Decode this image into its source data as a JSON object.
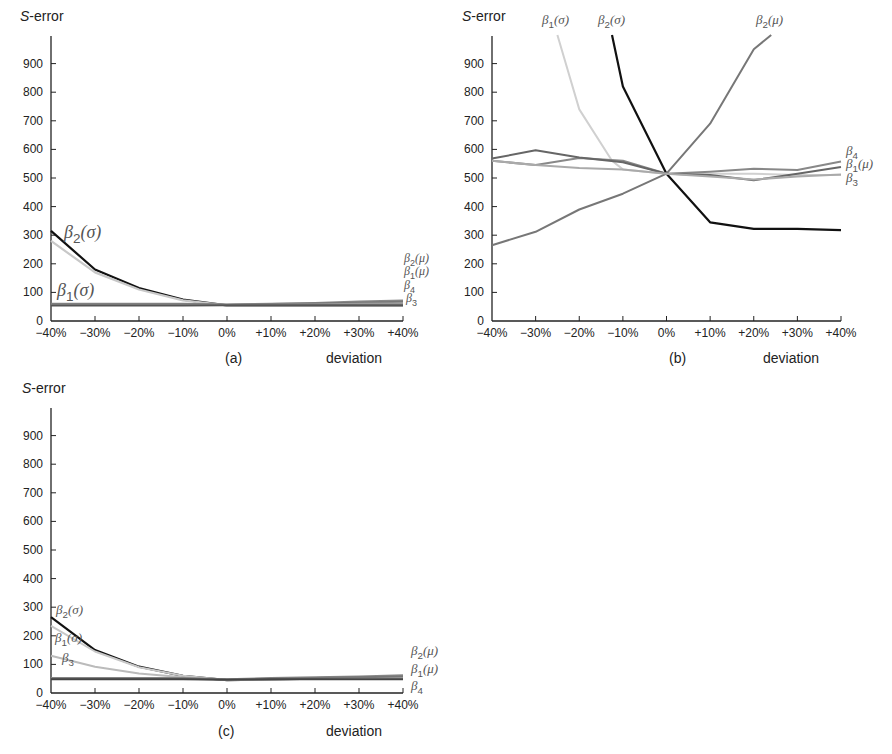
{
  "figure": {
    "ylabel_prefix": "S",
    "ylabel_suffix": "-error",
    "xlabel": "deviation"
  },
  "chart_data": [
    {
      "type": "line",
      "panel": "(a)",
      "title": "",
      "xlabel": "deviation",
      "ylabel": "S-error",
      "categories": [
        "-40%",
        "-30%",
        "-20%",
        "-10%",
        "0%",
        "+10%",
        "+20%",
        "+30%",
        "+40%"
      ],
      "yticks": [
        0,
        100,
        200,
        300,
        400,
        500,
        600,
        700,
        800,
        900
      ],
      "ylim": [
        0,
        1000
      ],
      "grid": false,
      "series": [
        {
          "name": "β2(σ)",
          "color": "#111111",
          "width": 2.2,
          "values": [
            315,
            180,
            115,
            75,
            55,
            55,
            55,
            55,
            55
          ]
        },
        {
          "name": "β1(σ)",
          "color": "#c8c8c8",
          "width": 2.2,
          "values": [
            280,
            170,
            110,
            72,
            55,
            55,
            55,
            55,
            55
          ]
        },
        {
          "name": "β2(μ)",
          "color": "#888888",
          "width": 2,
          "values": [
            60,
            60,
            60,
            60,
            58,
            60,
            63,
            68,
            72
          ]
        },
        {
          "name": "β1(μ)",
          "color": "#777777",
          "width": 2,
          "values": [
            58,
            58,
            58,
            58,
            57,
            59,
            61,
            64,
            67
          ]
        },
        {
          "name": "β4",
          "color": "#999999",
          "width": 2,
          "values": [
            56,
            56,
            56,
            56,
            56,
            57,
            58,
            60,
            62
          ]
        },
        {
          "name": "β3",
          "color": "#555555",
          "width": 2,
          "values": [
            54,
            54,
            54,
            54,
            55,
            55,
            55,
            55,
            55
          ]
        }
      ],
      "annotations": [
        {
          "text": "β2(σ)",
          "sub": "2",
          "base": "β",
          "arg": "(σ)",
          "x": 64,
          "y": 238,
          "size": 18,
          "color": "#222222"
        },
        {
          "text": "β1(σ)",
          "sub": "1",
          "base": "β",
          "arg": "(σ)",
          "x": 57,
          "y": 296,
          "size": 18,
          "color": "#444444"
        },
        {
          "text": "β2(μ)",
          "sub": "2",
          "base": "β",
          "arg": "(μ)",
          "x": 404,
          "y": 262,
          "size": 12,
          "color": "#666666"
        },
        {
          "text": "β1(μ)",
          "sub": "1",
          "base": "β",
          "arg": "(μ)",
          "x": 404,
          "y": 275,
          "size": 12,
          "color": "#666666"
        },
        {
          "text": "β4",
          "sub": "4",
          "base": "β",
          "arg": "",
          "x": 404,
          "y": 289,
          "size": 12,
          "color": "#666666"
        },
        {
          "text": "β3",
          "sub": "3",
          "base": "β",
          "arg": "",
          "x": 406,
          "y": 302,
          "size": 12,
          "color": "#666666"
        }
      ]
    },
    {
      "type": "line",
      "panel": "(b)",
      "title": "",
      "xlabel": "deviation",
      "ylabel": "S-error",
      "categories": [
        "-40%",
        "-30%",
        "-20%",
        "-10%",
        "0%",
        "+10%",
        "+20%",
        "+30%",
        "+40%"
      ],
      "yticks": [
        0,
        100,
        200,
        300,
        400,
        500,
        600,
        700,
        800,
        900
      ],
      "ylim": [
        0,
        1000
      ],
      "grid": false,
      "series": [
        {
          "name": "β2(σ)",
          "color": "#111111",
          "width": 2.2,
          "points": [
            [
              -12.5,
              1000
            ],
            [
              -10,
              820
            ],
            [
              0,
              515
            ],
            [
              10,
              345
            ],
            [
              20,
              322
            ],
            [
              30,
              322
            ],
            [
              40,
              318
            ]
          ]
        },
        {
          "name": "β1(σ)",
          "color": "#d0d0d0",
          "width": 2,
          "points": [
            [
              -25,
              1000
            ],
            [
              -20,
              740
            ],
            [
              -12.5,
              560
            ],
            [
              -10,
              530
            ],
            [
              0,
              515
            ],
            [
              10,
              515
            ],
            [
              20,
              515
            ],
            [
              30,
              510
            ],
            [
              40,
              510
            ]
          ]
        },
        {
          "name": "β2(μ)",
          "color": "#777777",
          "width": 2,
          "points": [
            [
              -40,
              265
            ],
            [
              -30,
              312
            ],
            [
              -20,
              390
            ],
            [
              -10,
              445
            ],
            [
              0,
              515
            ],
            [
              10,
              690
            ],
            [
              20,
              950
            ],
            [
              24,
              1000
            ]
          ]
        },
        {
          "name": "β4",
          "color": "#888888",
          "width": 2,
          "points": [
            [
              -40,
              560
            ],
            [
              -30,
              545
            ],
            [
              -20,
              570
            ],
            [
              -10,
              560
            ],
            [
              0,
              515
            ],
            [
              10,
              522
            ],
            [
              20,
              532
            ],
            [
              30,
              528
            ],
            [
              40,
              558
            ]
          ]
        },
        {
          "name": "β1(μ)",
          "color": "#666666",
          "width": 2,
          "points": [
            [
              -40,
              568
            ],
            [
              -30,
              597
            ],
            [
              -20,
              572
            ],
            [
              -10,
              555
            ],
            [
              0,
              515
            ],
            [
              10,
              510
            ],
            [
              20,
              492
            ],
            [
              30,
              515
            ],
            [
              40,
              538
            ]
          ]
        },
        {
          "name": "β3",
          "color": "#aaaaaa",
          "width": 2,
          "points": [
            [
              -40,
              560
            ],
            [
              -30,
              545
            ],
            [
              -20,
              535
            ],
            [
              -10,
              530
            ],
            [
              0,
              515
            ],
            [
              10,
              505
            ],
            [
              20,
              495
            ],
            [
              30,
              505
            ],
            [
              40,
              512
            ]
          ]
        }
      ],
      "annotations": [
        {
          "text": "β1(σ)",
          "sub": "1",
          "base": "β",
          "arg": "(σ)",
          "x": 542,
          "y": 24,
          "size": 13,
          "color": "#888888"
        },
        {
          "text": "β2(σ)",
          "sub": "2",
          "base": "β",
          "arg": "(σ)",
          "x": 598,
          "y": 24,
          "size": 13,
          "color": "#555555"
        },
        {
          "text": "β2(μ)",
          "sub": "2",
          "base": "β",
          "arg": "(μ)",
          "x": 756,
          "y": 24,
          "size": 13,
          "color": "#555555"
        },
        {
          "text": "β4",
          "sub": "4",
          "base": "β",
          "arg": "",
          "x": 846,
          "y": 155,
          "size": 13,
          "color": "#555555"
        },
        {
          "text": "β1(μ)",
          "sub": "1",
          "base": "β",
          "arg": "(μ)",
          "x": 846,
          "y": 168,
          "size": 13,
          "color": "#555555"
        },
        {
          "text": "β3",
          "sub": "3",
          "base": "β",
          "arg": "",
          "x": 846,
          "y": 182,
          "size": 13,
          "color": "#888888"
        }
      ]
    },
    {
      "type": "line",
      "panel": "(c)",
      "title": "",
      "xlabel": "deviation",
      "ylabel": "S-error",
      "categories": [
        "-40%",
        "-30%",
        "-20%",
        "-10%",
        "0%",
        "+10%",
        "+20%",
        "+30%",
        "+40%"
      ],
      "yticks": [
        0,
        100,
        200,
        300,
        400,
        500,
        600,
        700,
        800,
        900
      ],
      "ylim": [
        0,
        1000
      ],
      "grid": false,
      "series": [
        {
          "name": "β2(σ)",
          "color": "#111111",
          "width": 2.2,
          "values": [
            265,
            150,
            92,
            60,
            45,
            48,
            50,
            52,
            55
          ]
        },
        {
          "name": "β1(σ)",
          "color": "#c8c8c8",
          "width": 2,
          "values": [
            235,
            145,
            90,
            60,
            45,
            48,
            50,
            52,
            55
          ]
        },
        {
          "name": "β3",
          "color": "#bbbbbb",
          "width": 2,
          "values": [
            130,
            92,
            68,
            55,
            45,
            48,
            50,
            52,
            55
          ]
        },
        {
          "name": "β2(μ)",
          "color": "#888888",
          "width": 2,
          "values": [
            52,
            52,
            52,
            52,
            48,
            52,
            55,
            58,
            62
          ]
        },
        {
          "name": "β1(μ)",
          "color": "#777777",
          "width": 2,
          "values": [
            50,
            50,
            50,
            50,
            47,
            50,
            52,
            55,
            58
          ]
        },
        {
          "name": "β4",
          "color": "#444444",
          "width": 2,
          "values": [
            48,
            48,
            48,
            48,
            46,
            48,
            48,
            48,
            48
          ]
        }
      ],
      "annotations": [
        {
          "text": "β2(σ)",
          "sub": "2",
          "base": "β",
          "arg": "(σ)",
          "x": 56,
          "y": 614,
          "size": 13,
          "color": "#555555"
        },
        {
          "text": "β1(σ)",
          "sub": "1",
          "base": "β",
          "arg": "(σ)",
          "x": 55,
          "y": 642,
          "size": 13,
          "color": "#777777"
        },
        {
          "text": "β3",
          "sub": "3",
          "base": "β",
          "arg": "",
          "x": 62,
          "y": 662,
          "size": 13,
          "color": "#888888"
        },
        {
          "text": "β2(μ)",
          "sub": "2",
          "base": "β",
          "arg": "(μ)",
          "x": 411,
          "y": 655,
          "size": 13,
          "color": "#666666"
        },
        {
          "text": "β1(μ)",
          "sub": "1",
          "base": "β",
          "arg": "(μ)",
          "x": 411,
          "y": 673,
          "size": 13,
          "color": "#666666"
        },
        {
          "text": "β4",
          "sub": "4",
          "base": "β",
          "arg": "",
          "x": 411,
          "y": 690,
          "size": 13,
          "color": "#666666"
        }
      ]
    }
  ],
  "layout": [
    {
      "x0": 51,
      "x1": 403,
      "y0": 321,
      "ypx100": 28.6,
      "axis_top": 36,
      "ylabel_x": 20,
      "ylabel_y": 21,
      "panel_label_x": 225,
      "panel_label_y": 363,
      "xlabel_x": 326,
      "xlabel_y": 363
    },
    {
      "x0": 492,
      "x1": 841,
      "y0": 321,
      "ypx100": 28.6,
      "axis_top": 36,
      "ylabel_x": 462,
      "ylabel_y": 21,
      "panel_label_x": 669,
      "panel_label_y": 363,
      "xlabel_x": 763,
      "xlabel_y": 363
    },
    {
      "x0": 51,
      "x1": 403,
      "y0": 693,
      "ypx100": 28.6,
      "axis_top": 408,
      "ylabel_x": 22,
      "ylabel_y": 393,
      "panel_label_x": 218,
      "panel_label_y": 736,
      "xlabel_x": 326,
      "xlabel_y": 736
    }
  ]
}
